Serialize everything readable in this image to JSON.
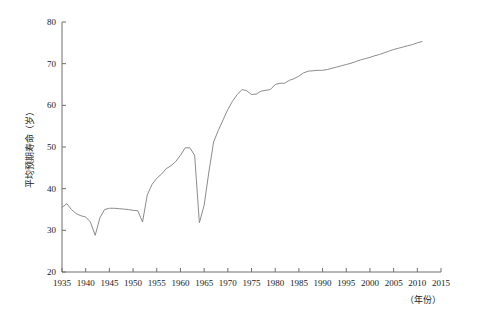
{
  "chart_data": {
    "type": "line",
    "title": "",
    "subtitle": "",
    "xlabel": "（年份）",
    "ylabel": "平均预期寿命（岁）",
    "xlim": [
      1935,
      2015
    ],
    "ylim": [
      20,
      80
    ],
    "grid": false,
    "legend": null,
    "legend_position": "none",
    "line_color": "#8c8c8c",
    "axis_color": "#6e6e6e",
    "xticks": [
      1935,
      1940,
      1945,
      1950,
      1955,
      1960,
      1965,
      1970,
      1975,
      1980,
      1985,
      1990,
      1995,
      2000,
      2005,
      2010,
      2015
    ],
    "xtick_labels": [
      "1935",
      "1940",
      "1945",
      "1950",
      "1955",
      "1960",
      "1965",
      "1970",
      "1975",
      "1980",
      "1985",
      "1990",
      "1995",
      "2000",
      "2005",
      "2010",
      "2015"
    ],
    "yticks": [
      20,
      30,
      40,
      50,
      60,
      70,
      80
    ],
    "ytick_labels": [
      "20",
      "30",
      "40",
      "50",
      "60",
      "70",
      "80"
    ],
    "series": [
      {
        "name": "平均预期寿命",
        "x": [
          1935,
          1936,
          1937,
          1938,
          1939,
          1940,
          1941,
          1942,
          1943,
          1944,
          1945,
          1946,
          1947,
          1948,
          1949,
          1950,
          1951,
          1952,
          1953,
          1954,
          1955,
          1956,
          1957,
          1958,
          1959,
          1960,
          1961,
          1962,
          1963,
          1964,
          1965,
          1966,
          1967,
          1968,
          1969,
          1970,
          1971,
          1972,
          1973,
          1974,
          1975,
          1976,
          1977,
          1978,
          1979,
          1980,
          1981,
          1982,
          1983,
          1984,
          1985,
          1986,
          1987,
          1988,
          1989,
          1990,
          1991,
          1992,
          1993,
          1994,
          1995,
          1996,
          1997,
          1998,
          1999,
          2000,
          2001,
          2002,
          2003,
          2004,
          2005,
          2006,
          2007,
          2008,
          2009,
          2010,
          2011
        ],
        "values": [
          35.5,
          36.4,
          35.0,
          34.0,
          33.5,
          33.2,
          32.0,
          28.8,
          33.0,
          35.0,
          35.3,
          35.3,
          35.2,
          35.1,
          35.0,
          34.8,
          34.7,
          32.0,
          38.5,
          41.0,
          42.5,
          43.5,
          44.8,
          45.5,
          46.5,
          48.0,
          49.8,
          49.8,
          48.0,
          31.8,
          36.0,
          44.0,
          51.2,
          54.0,
          56.5,
          59.0,
          61.0,
          62.6,
          63.8,
          63.5,
          62.6,
          62.7,
          63.4,
          63.6,
          63.8,
          65.0,
          65.3,
          65.3,
          66.0,
          66.4,
          67.0,
          67.8,
          68.2,
          68.3,
          68.4,
          68.4,
          68.6,
          68.9,
          69.2,
          69.5,
          69.8,
          70.1,
          70.5,
          70.9,
          71.2,
          71.5,
          71.9,
          72.2,
          72.6,
          73.0,
          73.4,
          73.7,
          74.0,
          74.3,
          74.6,
          75.0,
          75.3
        ]
      }
    ]
  },
  "axes": {
    "y_axis_title": "平均预期寿命（岁）",
    "x_axis_title": "（年份）"
  }
}
